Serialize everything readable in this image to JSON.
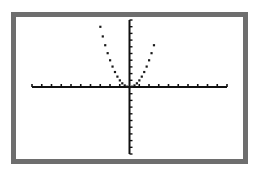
{
  "chart_data": {
    "type": "scatter",
    "title": "",
    "xlabel": "",
    "ylabel": "",
    "function": "y = x^2",
    "window": {
      "xmin": -10,
      "xmax": 10,
      "xscl": 1,
      "ymin": -10,
      "ymax": 10,
      "yscl": 1
    },
    "xlim": [
      -10,
      10
    ],
    "ylim": [
      -10,
      10
    ],
    "grid": false,
    "legend": "none",
    "series": [
      {
        "name": "Y1",
        "x": [
          -3,
          -2.75,
          -2.5,
          -2.25,
          -2,
          -1.75,
          -1.5,
          -1.25,
          -1,
          -0.75,
          -0.5,
          -0.25,
          0,
          0.25,
          0.5,
          0.75,
          1,
          1.25,
          1.5,
          1.75,
          2,
          2.25,
          2.5
        ],
        "values": [
          9,
          7.5625,
          6.25,
          5.0625,
          4,
          3.0625,
          2.25,
          1.5625,
          1,
          0.5625,
          0.25,
          0.0625,
          0,
          0.0625,
          0.25,
          0.5625,
          1,
          1.5625,
          2.25,
          3.0625,
          4,
          5.0625,
          6.25
        ]
      }
    ]
  },
  "screen": {
    "border_color": "#6e6e6e",
    "axis_color": "#111111",
    "dot_color": "#1a1a1a",
    "caption": "Graph of y = x^2 in dot mode"
  }
}
